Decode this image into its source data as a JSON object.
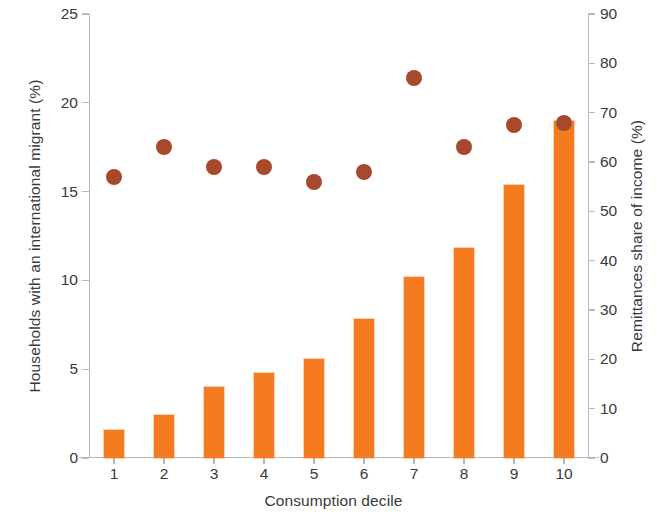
{
  "chart_data": {
    "type": "bar",
    "title": "",
    "xlabel": "Consumption decile",
    "ylabel": "Households with an international migrant (%)",
    "ylabel_right": "Remittances share of income (%)",
    "categories": [
      "1",
      "2",
      "3",
      "4",
      "5",
      "6",
      "7",
      "8",
      "9",
      "10"
    ],
    "series": [
      {
        "name": "Households with an international migrant (%)",
        "type": "bar",
        "axis": "left",
        "color": "#f47b20",
        "values": [
          1.6,
          2.4,
          4.0,
          4.8,
          5.6,
          7.8,
          10.2,
          11.8,
          15.4,
          19.0
        ]
      },
      {
        "name": "Remittances share of income (%)",
        "type": "scatter",
        "axis": "right",
        "color": "#a8482c",
        "values": [
          57,
          63,
          59,
          59,
          56,
          58,
          77,
          63,
          67.5,
          68
        ]
      }
    ],
    "ylim": [
      0,
      25
    ],
    "yticks": [
      "0",
      "5",
      "10",
      "15",
      "20",
      "25"
    ],
    "ylim_right": [
      0,
      90
    ],
    "yticks_right": [
      "0",
      "10",
      "20",
      "30",
      "40",
      "50",
      "60",
      "70",
      "80",
      "90"
    ],
    "grid": false,
    "legend": "none"
  }
}
